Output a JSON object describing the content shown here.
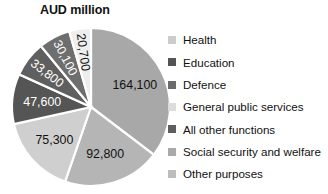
{
  "chart_data": {
    "type": "pie",
    "title": "AUD million",
    "xlabel": "",
    "ylabel": "",
    "legend_position": "right",
    "grid": false,
    "units": "AUD million",
    "total": 464400,
    "start_angle_deg": 0,
    "direction": "clockwise",
    "categories": [
      "Health",
      "Education",
      "Defence",
      "General public services",
      "All other functions",
      "Social security and welfare",
      "Other purposes"
    ],
    "values": [
      164100,
      47600,
      30100,
      75300,
      33800,
      92800,
      20700
    ],
    "value_labels": [
      "164,100",
      "47,600",
      "30,100",
      "75,300",
      "33,800",
      "92,800",
      "20,700"
    ],
    "colors": [
      "#a8a8a8",
      "#555555",
      "#6e6e6e",
      "#cfcfcf",
      "#5f5f5f",
      "#b5b5b5",
      "#eeeeee"
    ],
    "slices": [
      {
        "name": "Health",
        "value": 164100,
        "label": "164,100",
        "color": "#a8a8a8",
        "label_color": "#111111",
        "draw_order": 1,
        "rotated_label": false
      },
      {
        "name": "Social security and welfare",
        "value": 92800,
        "label": "92,800",
        "color": "#b5b5b5",
        "label_color": "#111111",
        "draw_order": 2,
        "rotated_label": false
      },
      {
        "name": "General public services",
        "value": 75300,
        "label": "75,300",
        "color": "#cfcfcf",
        "label_color": "#111111",
        "draw_order": 3,
        "rotated_label": false
      },
      {
        "name": "Education",
        "value": 47600,
        "label": "47,600",
        "color": "#555555",
        "label_color": "#ffffff",
        "draw_order": 4,
        "rotated_label": false
      },
      {
        "name": "All other functions",
        "value": 33800,
        "label": "33,800",
        "color": "#5f5f5f",
        "label_color": "#ffffff",
        "draw_order": 5,
        "rotated_label": true
      },
      {
        "name": "Defence",
        "value": 30100,
        "label": "30,100",
        "color": "#6e6e6e",
        "label_color": "#ffffff",
        "draw_order": 6,
        "rotated_label": true
      },
      {
        "name": "Other purposes",
        "value": 20700,
        "label": "20,700",
        "color": "#eeeeee",
        "label_color": "#111111",
        "draw_order": 7,
        "rotated_label": true
      }
    ]
  },
  "legend": {
    "items": [
      {
        "label": "Health",
        "color": "#cccccc"
      },
      {
        "label": "Education",
        "color": "#545454"
      },
      {
        "label": "Defence",
        "color": "#6b6b6b"
      },
      {
        "label": "General public services",
        "color": "#dcdcdc"
      },
      {
        "label": "All other functions",
        "color": "#5e5e5e"
      },
      {
        "label": "Social security and welfare",
        "color": "#a9a9a9"
      },
      {
        "label": "Other purposes",
        "color": "#bdbdbd"
      }
    ]
  }
}
